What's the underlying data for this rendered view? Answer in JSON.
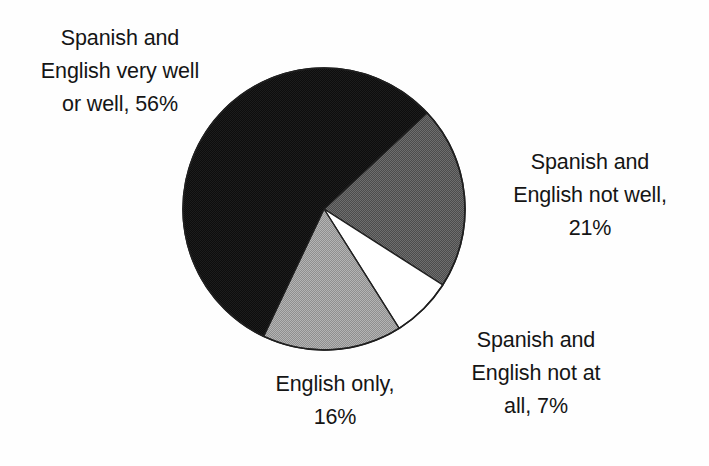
{
  "chart_data": {
    "type": "pie",
    "title": "",
    "subtitle": "",
    "xlabel": "",
    "ylabel": "",
    "legend_position": "none",
    "grid": false,
    "categories": [
      "Spanish and English very well or well",
      "Spanish and English not well",
      "Spanish and English not at all",
      "English only"
    ],
    "values": [
      56,
      21,
      7,
      16
    ],
    "value_unit": "%",
    "slice_colors": [
      "#111111",
      "#595959",
      "#ffffff",
      "#a0a0a0"
    ],
    "slices": [
      {
        "name": "spanish-and-english-very-well-or-well",
        "label": "Spanish and\nEnglish very well\nor well, 56%",
        "value": 56,
        "color": "#111111",
        "start_angle": 47,
        "end_angle": 248.6
      },
      {
        "name": "spanish-and-english-not-well",
        "label": "Spanish and\nEnglish not well,\n21%",
        "value": 21,
        "color": "#595959",
        "start_angle": 47,
        "end_angle": 122.6
      },
      {
        "name": "spanish-and-english-not-at-all",
        "label": "Spanish and\nEnglish not at\nall, 7%",
        "value": 7,
        "color": "#ffffff",
        "start_angle": 122.6,
        "end_angle": 147.8
      },
      {
        "name": "english-only",
        "label": "English only,\n16%",
        "value": 16,
        "color": "#a0a0a0",
        "start_angle": 147.8,
        "end_angle": 205.4
      }
    ]
  },
  "labels": {
    "very_well": "Spanish and\nEnglish very well\nor well, 56%",
    "not_well": "Spanish and\nEnglish not well,\n21%",
    "not_at_all": "Spanish and\nEnglish not at\nall, 7%",
    "english_only": "English only,\n16%"
  },
  "colors": {
    "background": "#fefefe",
    "outline": "#1a1a1a",
    "black_slice": "#111111",
    "dark_gray_slice": "#595959",
    "light_gray_slice": "#a0a0a0",
    "white_slice": "#ffffff",
    "text": "#151515"
  }
}
